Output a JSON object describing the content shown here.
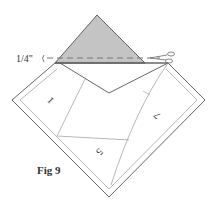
{
  "figure": {
    "caption": "Fig 9",
    "seam_allowance_label": "1/4\"",
    "pieces": [
      {
        "id": "piece-1",
        "label": "1"
      },
      {
        "id": "piece-5",
        "label": "5"
      },
      {
        "id": "piece-7",
        "label": "7"
      }
    ],
    "colors": {
      "shaded_triangle": "#c4c4c4",
      "line": "#555555",
      "light_line": "#999999",
      "dashed_line": "#777777"
    },
    "icons": [
      "scissors-icon"
    ]
  }
}
